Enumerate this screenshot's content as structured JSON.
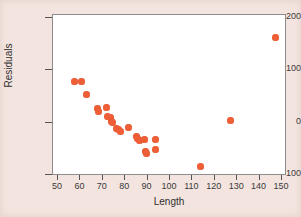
{
  "figure": {
    "background_color": "#f3e4df",
    "plot_background_color": "#ffffff",
    "frame_color": "#8d8d8d",
    "marker_color": "#ef5f37"
  },
  "chart_data": {
    "type": "scatter",
    "title": "",
    "xlabel": "Length",
    "ylabel": "Residuals",
    "xlim": [
      47,
      151
    ],
    "ylim": [
      -130,
      210
    ],
    "xticks": [
      50,
      60,
      70,
      80,
      90,
      100,
      110,
      120,
      130,
      140,
      150
    ],
    "xtick_labels": [
      "50",
      "60",
      "70",
      "80",
      "90",
      "100",
      "110",
      "120",
      "130",
      "140",
      "150"
    ],
    "yticks": [
      -100,
      0,
      100,
      200
    ],
    "ytick_labels": [
      "-100",
      "0",
      "100",
      "200"
    ],
    "grid": false,
    "legend": null,
    "marker": "filled-circle",
    "series": [
      {
        "name": "Residuals",
        "color": "#ef5f37",
        "points": [
          {
            "x": 57.5,
            "y": 79
          },
          {
            "x": 60.5,
            "y": 79
          },
          {
            "x": 62.5,
            "y": 54
          },
          {
            "x": 67.5,
            "y": 28
          },
          {
            "x": 68.0,
            "y": 21
          },
          {
            "x": 71.8,
            "y": 29
          },
          {
            "x": 72.0,
            "y": 12
          },
          {
            "x": 73.5,
            "y": 9
          },
          {
            "x": 74.0,
            "y": 3
          },
          {
            "x": 74.5,
            "y": 1
          },
          {
            "x": 76.0,
            "y": -12
          },
          {
            "x": 77.0,
            "y": -14
          },
          {
            "x": 78.0,
            "y": -17
          },
          {
            "x": 81.5,
            "y": -9
          },
          {
            "x": 85.0,
            "y": -26
          },
          {
            "x": 85.5,
            "y": -30
          },
          {
            "x": 86.5,
            "y": -34
          },
          {
            "x": 88.5,
            "y": -33
          },
          {
            "x": 89.0,
            "y": -55
          },
          {
            "x": 89.5,
            "y": -58
          },
          {
            "x": 93.5,
            "y": -32
          },
          {
            "x": 93.5,
            "y": -52
          },
          {
            "x": 113.5,
            "y": -84
          },
          {
            "x": 127.0,
            "y": 4
          },
          {
            "x": 147.0,
            "y": 163
          }
        ]
      }
    ]
  }
}
